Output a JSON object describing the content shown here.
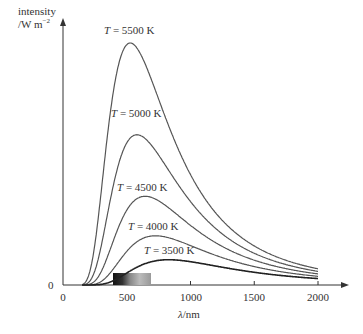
{
  "chart_data": {
    "type": "line",
    "title": "",
    "xlabel": "λ/nm",
    "ylabel": "intensity /W m⁻²",
    "xlim": [
      0,
      2100
    ],
    "ylim": [
      0,
      1
    ],
    "grid": false,
    "legend_position": "inline labels",
    "x_ticks": [
      "0",
      "500",
      "1000",
      "1500",
      "2000"
    ],
    "y_ticks": [
      "0"
    ],
    "series": [
      {
        "name": "T = 5500 K",
        "temperature": 5500,
        "peak_nm": 527,
        "relative_peak": 1.0
      },
      {
        "name": "T = 5000 K",
        "temperature": 5000,
        "peak_nm": 580,
        "relative_peak": 0.62
      },
      {
        "name": "T = 4500 K",
        "temperature": 4500,
        "peak_nm": 644,
        "relative_peak": 0.37
      },
      {
        "name": "T = 4000 K",
        "temperature": 4000,
        "peak_nm": 725,
        "relative_peak": 0.2
      },
      {
        "name": "T = 3500 K",
        "temperature": 3500,
        "peak_nm": 828,
        "relative_peak": 0.1
      }
    ],
    "annotations": [
      "visible spectrum band ~400–700 nm shown on x-axis"
    ]
  },
  "labels": {
    "y_axis_line1": "intensity",
    "y_axis_line2": "/W m",
    "y_axis_sup": "−2",
    "x_axis_lambda": "λ",
    "x_axis_unit": "/nm",
    "zero_y": "0",
    "T": "T",
    "curve_5500": "= 5500 K",
    "curve_5000": "= 5000 K",
    "curve_4500": "= 4500 K",
    "curve_4000": "= 4000 K",
    "curve_3500": "= 3500 K"
  },
  "colors": {
    "axis": "#333333",
    "curve": "#555555",
    "curve_3500": "#222222"
  }
}
